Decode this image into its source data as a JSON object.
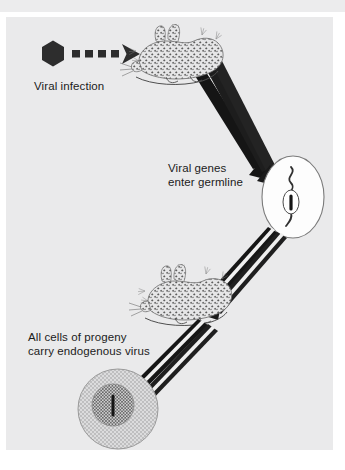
{
  "figure": {
    "background_color": "#eaeaeb",
    "page_color": "#ffffff",
    "ink_color": "#1b1b1b"
  },
  "labels": {
    "viral_infection": "Viral infection",
    "viral_genes_line1": "Viral genes",
    "viral_genes_line2": "enter germline",
    "progeny_line1": "All cells of progeny",
    "progeny_line2": "carry endogenous virus"
  },
  "elements": {
    "virus_particle": "hexagon-virus-icon",
    "infection_arrow": "dashed-arrow-icon",
    "mouse_infected": "mouse-illustration",
    "mouse_progeny": "mouse-illustration",
    "egg_cell": "egg-cell-illustration",
    "provirus_strand": "wavy-chromosome-icon",
    "progeny_cell": "stippled-cell-illustration",
    "nucleus": "cell-nucleus",
    "arrows_to_egg": "converging-arrows",
    "arrows_to_mouse2": "converging-arrows",
    "arrows_to_cell": "converging-arrows"
  },
  "colors": {
    "panel": "#eaeaeb",
    "strip": "#ececed",
    "arrow_dark": "#181818",
    "arrow_light": "#f2f2f2",
    "virus": "#2b2b2b",
    "egg_fill": "#fdfdfd",
    "egg_stroke": "#6e6e6e",
    "cell_fill": "#d9d9da",
    "nucleus_fill": "#c9c9ca",
    "mouse_fill": "#e4e4e5",
    "mouse_stipple": "#5a5a5a",
    "text": "#1b1b1b"
  }
}
